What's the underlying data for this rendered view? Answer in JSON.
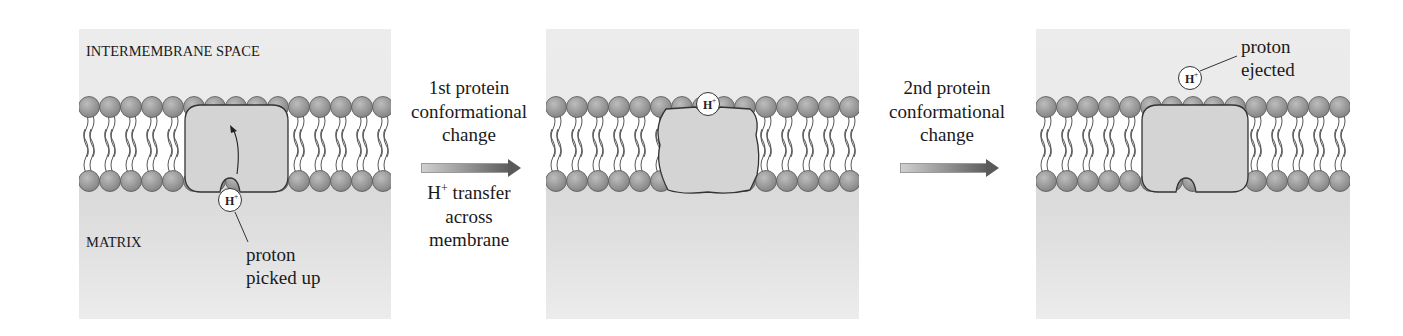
{
  "figure": {
    "colors": {
      "background": "#ffffff",
      "compartment": "#e9e9e9",
      "matrix": "#dcdcdc",
      "lipid_head": "#9a9a9a",
      "protein": "#d4d4d4",
      "outline": "#333333"
    },
    "panels": [
      {
        "id": "panel-1",
        "x": 79,
        "width": 312,
        "labels": {
          "top": "INTERMEMBRANE SPACE",
          "bottom": "MATRIX"
        },
        "protein": {
          "x": 106,
          "w": 103,
          "notch": "bottom",
          "shape": "smooth"
        },
        "proton": {
          "label": "H+",
          "cx": 151,
          "cy": 171
        },
        "callout": {
          "lines": [
            "proton",
            "picked up"
          ]
        },
        "state": "proton picked up from matrix"
      },
      {
        "id": "panel-2",
        "x": 546,
        "width": 313,
        "protein": {
          "x": 112,
          "w": 100,
          "notch": "top",
          "shape": "wavy"
        },
        "proton": {
          "label": "H+",
          "cx": 162,
          "cy": 75
        },
        "state": "proton transferred across membrane"
      },
      {
        "id": "panel-3",
        "x": 1036,
        "width": 314,
        "protein": {
          "x": 106,
          "w": 106,
          "notch": "bottom",
          "shape": "smooth"
        },
        "proton": {
          "label": "H+",
          "cx": 154,
          "cy": 49
        },
        "callout": {
          "lines": [
            "proton",
            "ejected"
          ]
        },
        "state": "proton ejected into intermembrane space"
      }
    ],
    "steps": [
      {
        "id": "step-1",
        "title_lines": [
          "1st protein",
          "conformational",
          "change"
        ],
        "subtitle": {
          "h": "H",
          "sup": "+",
          "rest": " transfer",
          "lines": [
            "across",
            "membrane"
          ]
        }
      },
      {
        "id": "step-2",
        "title_lines": [
          "2nd protein",
          "conformational",
          "change"
        ]
      }
    ],
    "proton_symbol": {
      "base": "H",
      "sup": "+"
    }
  }
}
